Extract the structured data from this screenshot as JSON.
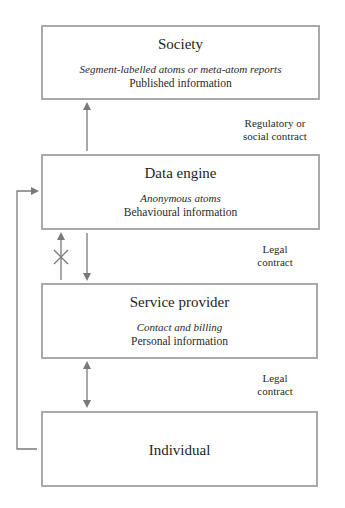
{
  "diagram": {
    "nodes": [
      {
        "id": "society",
        "title": "Society",
        "subtitle": "Segment-labelled atoms or meta-atom reports",
        "description": "Published information"
      },
      {
        "id": "data-engine",
        "title": "Data engine",
        "subtitle": "Anonymous atoms",
        "description": "Behavioural information"
      },
      {
        "id": "service-provider",
        "title": "Service provider",
        "subtitle": "Contact and billing",
        "description": "Personal information"
      },
      {
        "id": "individual",
        "title": "Individual"
      }
    ],
    "edge_labels": {
      "data_engine_to_society": {
        "line1": "Regulatory or",
        "line2": "social contract"
      },
      "service_provider_to_data_engine": {
        "line1": "Legal",
        "line2": "contract"
      },
      "individual_to_service_provider": {
        "line1": "Legal",
        "line2": "contract"
      }
    },
    "edges": [
      {
        "from": "data-engine",
        "to": "society",
        "type": "single-arrow-up"
      },
      {
        "from": "service-provider",
        "to": "data-engine",
        "type": "blocked-arrow-up",
        "marker": "cross"
      },
      {
        "from": "data-engine",
        "to": "service-provider",
        "type": "single-arrow-down"
      },
      {
        "from": "service-provider",
        "to": "individual",
        "type": "double-arrow"
      },
      {
        "from": "individual",
        "to": "data-engine",
        "type": "elbow-arrow-left-side"
      }
    ],
    "colors": {
      "box_border": "#a9a9a9",
      "arrow": "#7a7a7a",
      "text": "#222222"
    }
  }
}
